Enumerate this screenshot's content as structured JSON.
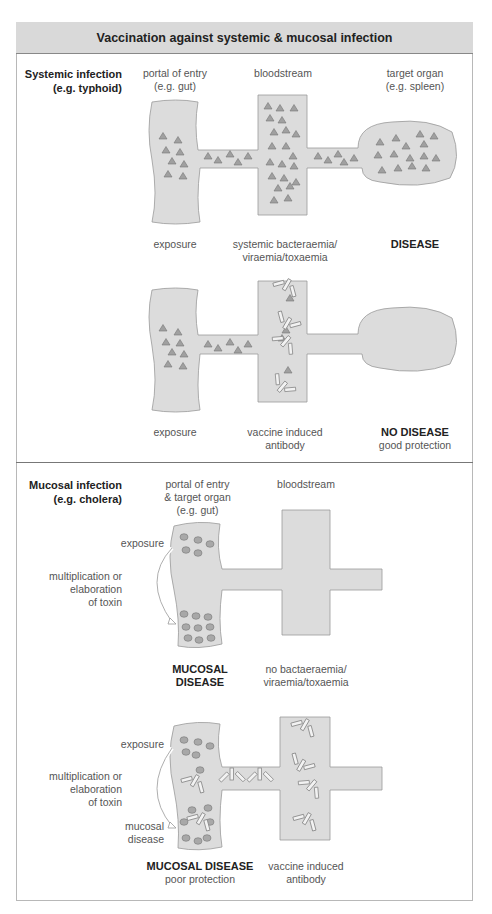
{
  "title": "Vaccination against systemic & mucosal infection",
  "systemic": {
    "heading": "Systemic infection",
    "example": "(e.g. typhoid)",
    "col_portal_1": "portal of entry",
    "col_portal_2": "(e.g. gut)",
    "col_blood": "bloodstream",
    "col_target_1": "target organ",
    "col_target_2": "(e.g. spleen)",
    "unvaccinated": {
      "exposure": "exposure",
      "blood_1": "systemic bacteraemia/",
      "blood_2": "viraemia/toxaemia",
      "outcome": "DISEASE"
    },
    "vaccinated": {
      "exposure": "exposure",
      "blood_1": "vaccine induced",
      "blood_2": "antibody",
      "outcome": "NO DISEASE",
      "outcome_note": "good protection"
    }
  },
  "mucosal": {
    "heading": "Mucosal infection",
    "example": "(e.g. cholera)",
    "col_portal_1": "portal of entry",
    "col_portal_2": "& target organ",
    "col_portal_3": "(e.g. gut)",
    "col_blood": "bloodstream",
    "unvaccinated": {
      "exposure": "exposure",
      "mult_1": "multiplication or",
      "mult_2": "elaboration",
      "mult_3": "of toxin",
      "outcome_1": "MUCOSAL",
      "outcome_2": "DISEASE",
      "blood_1": "no bactaeraemia/",
      "blood_2": "viraemia/toxaemia"
    },
    "vaccinated": {
      "exposure": "exposure",
      "mult_1": "multiplication or",
      "mult_2": "elaboration",
      "mult_3": "of toxin",
      "mucosal_1": "mucosal",
      "mucosal_2": "disease",
      "outcome": "MUCOSAL DISEASE",
      "outcome_note": "poor protection",
      "blood_1": "vaccine induced",
      "blood_2": "antibody"
    }
  },
  "colors": {
    "tissue_fill": "#dcdcdc",
    "tissue_stroke": "#999999",
    "pathogen": "#9a9a9a",
    "header_bg": "#d9d9d9"
  }
}
